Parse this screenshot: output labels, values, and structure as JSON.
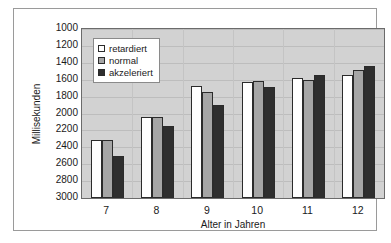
{
  "chart_data": {
    "type": "bar",
    "title": "",
    "xlabel": "Alter in Jahren",
    "ylabel": "Millisekunden",
    "categories": [
      "7",
      "8",
      "9",
      "10",
      "11",
      "12"
    ],
    "series": [
      {
        "name": "retardiert",
        "color": "#ffffff",
        "values": [
          2310,
          2040,
          1680,
          1630,
          1585,
          1545
        ]
      },
      {
        "name": "normal",
        "color": "#a6a6a6",
        "values": [
          2310,
          2040,
          1740,
          1610,
          1600,
          1485
        ]
      },
      {
        "name": "akzeleriert",
        "color": "#2e2e2e",
        "values": [
          2505,
          2145,
          1900,
          1690,
          1550,
          1440
        ]
      }
    ],
    "yticks": [
      1000,
      1200,
      1400,
      1600,
      1800,
      2000,
      2200,
      2400,
      2600,
      2800,
      3000
    ],
    "ylim": [
      1000,
      3000
    ],
    "y_axis_inverted": true,
    "grid": true,
    "legend_position": "upper-left",
    "plot_background": "#d2d2d2",
    "bar_edge_color": "#2b2b2b"
  },
  "axes": {
    "y_title": "Millisekunden",
    "x_title": "Alter in Jahren"
  },
  "legend": {
    "items": [
      {
        "label": "retardiert"
      },
      {
        "label": "normal"
      },
      {
        "label": "akzeleriert"
      }
    ]
  }
}
